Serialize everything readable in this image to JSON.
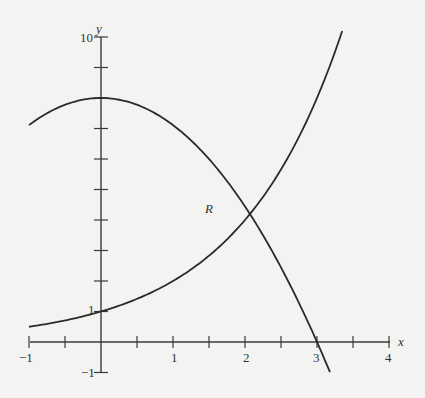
{
  "chart_data": {
    "type": "line",
    "title": "",
    "xlabel": "x",
    "ylabel": "y",
    "xlim": [
      -1,
      4
    ],
    "ylim": [
      -1,
      10
    ],
    "grid": false,
    "legend": null,
    "x_tick_labels": [
      "-1",
      "1",
      "2",
      "3",
      "4"
    ],
    "x_ticks": [
      -1,
      -0.5,
      0,
      0.5,
      1,
      1.5,
      2,
      2.5,
      3,
      3.5,
      4
    ],
    "y_tick_labels": [
      "-1",
      "1",
      "10"
    ],
    "y_ticks": [
      -1,
      1,
      2,
      3,
      4,
      5,
      6,
      7,
      8,
      9,
      10
    ],
    "series": [
      {
        "name": "exponential curve (y = 2^x)",
        "x": [
          -1,
          -0.5,
          0,
          0.5,
          1,
          1.5,
          2,
          2.5,
          3,
          3.35
        ],
        "values": [
          0.5,
          0.71,
          1,
          1.41,
          2,
          2.83,
          4,
          5.66,
          8,
          10.2
        ]
      },
      {
        "name": "downward parabola (y = 8 - (8/9)x^2)",
        "x": [
          -1,
          -0.5,
          0,
          0.5,
          1,
          1.5,
          2,
          2.5,
          3,
          3.18
        ],
        "values": [
          7.11,
          7.78,
          8,
          7.78,
          7.11,
          6,
          4.44,
          2.44,
          0,
          -0.99
        ]
      }
    ],
    "annotations": [
      {
        "text": "R",
        "x": 1.55,
        "y": 5.0,
        "note": "region label near intersection"
      },
      {
        "text": "intersection",
        "x": 2.07,
        "y": 4.2
      }
    ]
  },
  "labels": {
    "x_axis": "x",
    "y_axis": "y",
    "region": "R",
    "x_neg1": "−1",
    "x_1": "1",
    "x_2": "2",
    "x_3": "3",
    "x_4": "4",
    "y_1": "1",
    "y_10": "10",
    "y_neg1": "−1"
  }
}
